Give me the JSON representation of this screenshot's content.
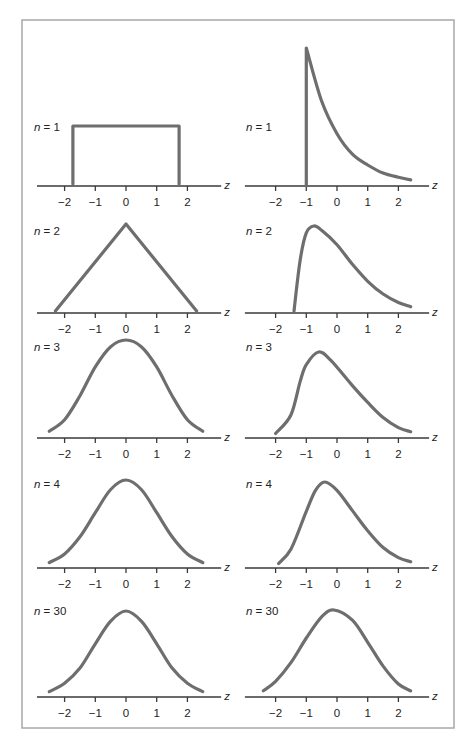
{
  "chart_data": {
    "type": "line",
    "title": "",
    "layout": {
      "columns": 2,
      "rows": 5,
      "grid": false,
      "legend": "none"
    },
    "xlabel": "z",
    "ylabel": "",
    "xlim": [
      -2.6,
      2.7
    ],
    "x_ticks": [
      -2,
      -1,
      0,
      1,
      2
    ],
    "x_tick_labels": [
      "−2",
      "−1",
      "0",
      "1",
      "2"
    ],
    "columns": [
      {
        "name": "symmetric (uniform parent)",
        "panels": [
          {
            "label_var": "n",
            "label_eq": " = 1",
            "n": 1,
            "shape": "uniform",
            "points": [
              [
                -1.73,
                0
              ],
              [
                -1.73,
                1
              ],
              [
                1.73,
                1
              ],
              [
                1.73,
                0
              ]
            ]
          },
          {
            "label_var": "n",
            "label_eq": " = 2",
            "n": 2,
            "shape": "triangular",
            "points": [
              [
                -2.3,
                0
              ],
              [
                0,
                1
              ],
              [
                2.3,
                0
              ]
            ]
          },
          {
            "label_var": "n",
            "label_eq": " = 3",
            "n": 3,
            "shape": "bell",
            "points": [
              [
                -2.5,
                0.05
              ],
              [
                -2,
                0.17
              ],
              [
                -1.5,
                0.42
              ],
              [
                -1,
                0.72
              ],
              [
                -0.5,
                0.93
              ],
              [
                0,
                1
              ],
              [
                0.5,
                0.93
              ],
              [
                1,
                0.72
              ],
              [
                1.5,
                0.42
              ],
              [
                2,
                0.17
              ],
              [
                2.5,
                0.05
              ]
            ]
          },
          {
            "label_var": "n",
            "label_eq": " = 4",
            "n": 4,
            "shape": "bell",
            "points": [
              [
                -2.5,
                0.04
              ],
              [
                -2,
                0.14
              ],
              [
                -1.5,
                0.34
              ],
              [
                -1,
                0.62
              ],
              [
                -0.5,
                0.89
              ],
              [
                0,
                1
              ],
              [
                0.5,
                0.89
              ],
              [
                1,
                0.62
              ],
              [
                1.5,
                0.34
              ],
              [
                2,
                0.14
              ],
              [
                2.5,
                0.04
              ]
            ]
          },
          {
            "label_var": "n",
            "label_eq": " = 30",
            "n": 30,
            "shape": "normal",
            "points": [
              [
                -2.5,
                0.04
              ],
              [
                -2,
                0.14
              ],
              [
                -1.5,
                0.32
              ],
              [
                -1,
                0.61
              ],
              [
                -0.5,
                0.88
              ],
              [
                0,
                1
              ],
              [
                0.5,
                0.88
              ],
              [
                1,
                0.61
              ],
              [
                1.5,
                0.32
              ],
              [
                2,
                0.14
              ],
              [
                2.5,
                0.04
              ]
            ]
          }
        ]
      },
      {
        "name": "skewed (exponential parent)",
        "panels": [
          {
            "label_var": "n",
            "label_eq": " = 1",
            "n": 1,
            "shape": "exponential",
            "points": [
              [
                -1,
                0
              ],
              [
                -1,
                1
              ],
              [
                -0.5,
                0.61
              ],
              [
                0,
                0.37
              ],
              [
                0.5,
                0.22
              ],
              [
                1,
                0.14
              ],
              [
                1.5,
                0.08
              ],
              [
                2,
                0.05
              ],
              [
                2.4,
                0.03
              ]
            ]
          },
          {
            "label_var": "n",
            "label_eq": " = 2",
            "n": 2,
            "shape": "right-skewed",
            "points": [
              [
                -1.4,
                0
              ],
              [
                -1.2,
                0.6
              ],
              [
                -1,
                0.92
              ],
              [
                -0.75,
                1
              ],
              [
                -0.5,
                0.95
              ],
              [
                0,
                0.78
              ],
              [
                0.5,
                0.55
              ],
              [
                1,
                0.35
              ],
              [
                1.5,
                0.2
              ],
              [
                2,
                0.1
              ],
              [
                2.4,
                0.05
              ]
            ]
          },
          {
            "label_var": "n",
            "label_eq": " = 3",
            "n": 3,
            "shape": "right-skewed",
            "points": [
              [
                -2,
                0.03
              ],
              [
                -1.5,
                0.25
              ],
              [
                -1.2,
                0.65
              ],
              [
                -1,
                0.85
              ],
              [
                -0.6,
                1
              ],
              [
                -0.2,
                0.9
              ],
              [
                0.5,
                0.6
              ],
              [
                1,
                0.4
              ],
              [
                1.5,
                0.22
              ],
              [
                2,
                0.1
              ],
              [
                2.4,
                0.05
              ]
            ]
          },
          {
            "label_var": "n",
            "label_eq": " = 4",
            "n": 4,
            "shape": "right-skewed",
            "points": [
              [
                -1.9,
                0.03
              ],
              [
                -1.5,
                0.2
              ],
              [
                -1,
                0.65
              ],
              [
                -0.7,
                0.9
              ],
              [
                -0.4,
                1
              ],
              [
                0,
                0.9
              ],
              [
                0.5,
                0.66
              ],
              [
                1,
                0.42
              ],
              [
                1.5,
                0.22
              ],
              [
                2,
                0.1
              ],
              [
                2.4,
                0.05
              ]
            ]
          },
          {
            "label_var": "n",
            "label_eq": " = 30",
            "n": 30,
            "shape": "near-normal",
            "points": [
              [
                -2.4,
                0.05
              ],
              [
                -2,
                0.16
              ],
              [
                -1.5,
                0.38
              ],
              [
                -1,
                0.67
              ],
              [
                -0.5,
                0.92
              ],
              [
                -0.1,
                1
              ],
              [
                0.5,
                0.88
              ],
              [
                1,
                0.62
              ],
              [
                1.5,
                0.34
              ],
              [
                2,
                0.13
              ],
              [
                2.4,
                0.05
              ]
            ]
          }
        ]
      }
    ]
  }
}
